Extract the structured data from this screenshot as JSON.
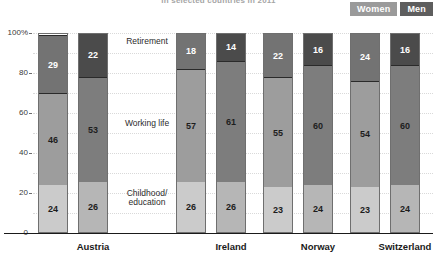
{
  "title": "in selected countries in 2011",
  "legend": {
    "position": "top-right",
    "items": [
      {
        "label": "Women",
        "color": "#9a9a9a"
      },
      {
        "label": "Men",
        "color": "#5e5e5e"
      }
    ]
  },
  "axis": {
    "y_ticks": [
      "100%",
      "80",
      "60",
      "40",
      "20",
      "0"
    ],
    "y_values": [
      100,
      80,
      60,
      40,
      20,
      0
    ],
    "ylim": [
      0,
      100
    ]
  },
  "segment_captions": {
    "retirement": "Retirement",
    "working": "Working life",
    "childhood_line1": "Childhood/",
    "childhood_line2": "education"
  },
  "chart_data": {
    "type": "bar",
    "title": "in selected countries in 2011",
    "xlabel": "",
    "ylabel": "",
    "ylim": [
      0,
      100
    ],
    "grid": true,
    "stacked": true,
    "legend_position": "top-right",
    "categories": [
      "Austria",
      "Ireland",
      "Norway",
      "Switzerland"
    ],
    "groups": [
      "Women",
      "Men"
    ],
    "segments": [
      "Childhood/education",
      "Working life",
      "Retirement"
    ],
    "series": [
      {
        "name": "Childhood/education - Women",
        "values": [
          24,
          26,
          23,
          23
        ]
      },
      {
        "name": "Working life - Women",
        "values": [
          46,
          57,
          55,
          54
        ]
      },
      {
        "name": "Retirement - Women",
        "values": [
          29,
          18,
          22,
          24
        ]
      },
      {
        "name": "Childhood/education - Men",
        "values": [
          26,
          26,
          24,
          24
        ]
      },
      {
        "name": "Working life - Men",
        "values": [
          53,
          61,
          60,
          60
        ]
      },
      {
        "name": "Retirement - Men",
        "values": [
          22,
          14,
          16,
          16
        ]
      }
    ]
  },
  "bars": [
    {
      "country": "Austria",
      "gender": "Women",
      "childhood": 24,
      "working": 46,
      "retirement": 29
    },
    {
      "country": "Austria",
      "gender": "Men",
      "childhood": 26,
      "working": 53,
      "retirement": 22
    },
    {
      "country": "Ireland",
      "gender": "Women",
      "childhood": 26,
      "working": 57,
      "retirement": 18
    },
    {
      "country": "Ireland",
      "gender": "Men",
      "childhood": 26,
      "working": 61,
      "retirement": 14
    },
    {
      "country": "Norway",
      "gender": "Women",
      "childhood": 23,
      "working": 55,
      "retirement": 22
    },
    {
      "country": "Norway",
      "gender": "Men",
      "childhood": 24,
      "working": 60,
      "retirement": 16
    },
    {
      "country": "Switzerland",
      "gender": "Women",
      "childhood": 23,
      "working": 54,
      "retirement": 24
    },
    {
      "country": "Switzerland",
      "gender": "Men",
      "childhood": 24,
      "working": 60,
      "retirement": 16
    }
  ]
}
